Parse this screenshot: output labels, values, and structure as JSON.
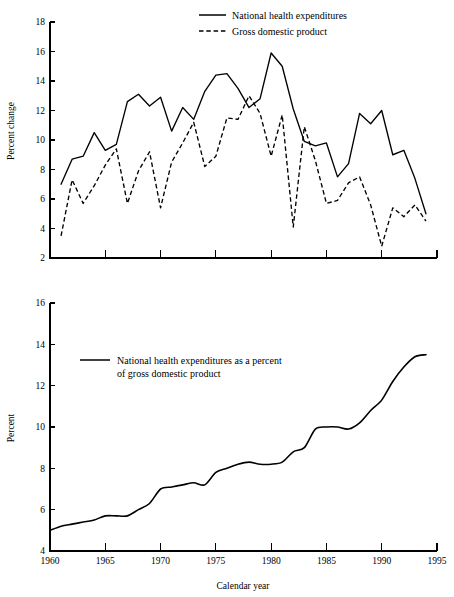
{
  "figure": {
    "background": "#ffffff",
    "ink": "#000000",
    "width": 454,
    "height": 597
  },
  "chart_data": [
    {
      "id": "top-panel",
      "type": "line",
      "title": "",
      "xlabel": "",
      "ylabel": "Percent change",
      "xlim": [
        1960,
        1995
      ],
      "ylim": [
        2,
        18
      ],
      "grid": false,
      "legend_position": "top-right",
      "x_tick_labels": [
        "",
        "",
        "",
        "",
        "",
        "",
        "",
        ""
      ],
      "x_ticks": [
        1960,
        1965,
        1970,
        1975,
        1980,
        1985,
        1990,
        1995
      ],
      "y_ticks": [
        2,
        4,
        6,
        8,
        10,
        12,
        14,
        16,
        18
      ],
      "y_tick_labels": [
        "2",
        "4",
        "6",
        "8",
        "10",
        "12",
        "14",
        "16",
        "18"
      ],
      "x": [
        1961,
        1962,
        1963,
        1964,
        1965,
        1966,
        1967,
        1968,
        1969,
        1970,
        1971,
        1972,
        1973,
        1974,
        1975,
        1976,
        1977,
        1978,
        1979,
        1980,
        1981,
        1982,
        1983,
        1984,
        1985,
        1986,
        1987,
        1988,
        1989,
        1990,
        1991,
        1992,
        1993,
        1994
      ],
      "series": [
        {
          "name": "National health expenditures",
          "style": "solid",
          "values": [
            7.0,
            8.7,
            8.9,
            10.5,
            9.3,
            9.7,
            12.6,
            13.1,
            12.3,
            12.9,
            10.6,
            12.2,
            11.4,
            13.3,
            14.4,
            14.5,
            13.5,
            12.2,
            12.8,
            15.9,
            15.0,
            12.1,
            9.9,
            9.6,
            9.8,
            7.5,
            8.4,
            11.8,
            11.1,
            12.0,
            9.0,
            9.3,
            7.4,
            5.0,
            5.3
          ]
        },
        {
          "name": "Gross domestic product",
          "style": "dashed",
          "values": [
            3.5,
            7.3,
            5.7,
            6.9,
            8.3,
            9.4,
            5.7,
            7.9,
            9.2,
            5.4,
            8.5,
            9.8,
            11.2,
            8.2,
            8.9,
            11.5,
            11.4,
            13.0,
            11.8,
            8.9,
            11.7,
            4.1,
            10.9,
            8.6,
            5.7,
            5.9,
            7.1,
            7.5,
            5.6,
            2.8,
            5.4,
            4.8,
            5.6,
            4.5
          ]
        }
      ]
    },
    {
      "id": "bottom-panel",
      "type": "line",
      "title": "",
      "xlabel": "Calendar year",
      "ylabel": "Percent",
      "xlim": [
        1960,
        1995
      ],
      "ylim": [
        4,
        16
      ],
      "grid": false,
      "legend_position": "upper-left-inside",
      "x_ticks": [
        1960,
        1965,
        1970,
        1975,
        1980,
        1985,
        1990,
        1995
      ],
      "x_tick_labels": [
        "1960",
        "1965",
        "1970",
        "1975",
        "1980",
        "1985",
        "1990",
        "1995"
      ],
      "y_ticks": [
        4,
        6,
        8,
        10,
        12,
        14,
        16
      ],
      "y_tick_labels": [
        "4",
        "6",
        "8",
        "10",
        "12",
        "14",
        "16"
      ],
      "x": [
        1960,
        1961,
        1962,
        1963,
        1964,
        1965,
        1966,
        1967,
        1968,
        1969,
        1970,
        1971,
        1972,
        1973,
        1974,
        1975,
        1976,
        1977,
        1978,
        1979,
        1980,
        1981,
        1982,
        1983,
        1984,
        1985,
        1986,
        1987,
        1988,
        1989,
        1990,
        1991,
        1992,
        1993,
        1994
      ],
      "series": [
        {
          "name": "National health expenditures as a percent of gross domestic product",
          "style": "solid",
          "values": [
            5.0,
            5.2,
            5.3,
            5.4,
            5.5,
            5.7,
            5.7,
            5.7,
            6.0,
            6.3,
            7.0,
            7.1,
            7.2,
            7.3,
            7.2,
            7.8,
            8.0,
            8.2,
            8.3,
            8.2,
            8.2,
            8.3,
            8.8,
            9.0,
            9.9,
            10.0,
            10.0,
            9.9,
            10.2,
            10.8,
            11.3,
            12.2,
            12.9,
            13.4,
            13.5
          ]
        }
      ]
    }
  ],
  "top_legend": {
    "entries": [
      {
        "label": "National health expenditures",
        "style": "solid"
      },
      {
        "label": "Gross domestic product",
        "style": "dashed"
      }
    ]
  },
  "bottom_legend": {
    "line1": "National health expenditures as a percent",
    "line2": "of gross domestic product",
    "style": "solid"
  },
  "axis_titles": {
    "top_y": "Percent change",
    "bottom_y": "Percent",
    "bottom_x": "Calendar year"
  }
}
